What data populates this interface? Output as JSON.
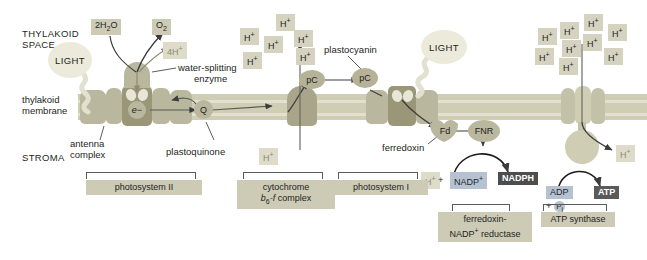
{
  "figure": {
    "regions": {
      "thylakoid_space": "THYLAKOID\nSPACE",
      "thylakoid_space_line1": "THYLAKOID",
      "thylakoid_space_line2": "SPACE",
      "membrane_line1": "thylakoid",
      "membrane_line2": "membrane",
      "stroma": "STROMA"
    },
    "light_labels": [
      "LIGHT",
      "LIGHT"
    ],
    "molecules": {
      "water": "2H2O",
      "oxygen": "O2",
      "four_protons": "4H+",
      "electron": "e−",
      "plastoquinone_symbol": "Q",
      "plastocyanin_symbol_1": "pC",
      "plastocyanin_symbol_2": "pC",
      "ferredoxin_symbol": "Fd",
      "fnr_symbol": "FNR",
      "proton": "H+",
      "nadp_plus": "NADP+",
      "nadph": "NADPH",
      "adp": "ADP",
      "plus": "+",
      "phosphate": "P",
      "phosphate_sub": "i",
      "atp": "ATP"
    },
    "callouts": {
      "water_splitting_enzyme_line1": "water-splitting",
      "water_splitting_enzyme_line2": "enzyme",
      "antenna_complex_line1": "antenna",
      "antenna_complex_line2": "complex",
      "plastoquinone": "plastoquinone",
      "plastocyanin": "plastocyanin",
      "ferredoxin": "ferredoxin"
    },
    "complex_labels": {
      "photosystem_ii": "photosystem II",
      "cytochrome_line1": "cytochrome",
      "cytochrome_line2_pre": "b",
      "cytochrome_line2_sub": "6",
      "cytochrome_line2_post": "-f complex",
      "photosystem_i": "photosystem I",
      "ferredoxin_reductase_line1": "ferredoxin-",
      "ferredoxin_reductase_line2_pre": "NADP",
      "ferredoxin_reductase_line2_sup": "+",
      "ferredoxin_reductase_line2_post": " reductase",
      "atp_synthase": "ATP synthase"
    },
    "proton_clusters": {
      "cytochrome_pumped_count": 6,
      "atp_synthase_side_count": 9,
      "cytochrome_pumped": [
        "H+",
        "H+",
        "H+",
        "H+",
        "H+",
        "H+"
      ],
      "atp_synthase_side": [
        "H+",
        "H+",
        "H+",
        "H+",
        "H+",
        "H+",
        "H+",
        "H+",
        "H+"
      ],
      "stroma_protons": [
        "H+",
        "H+"
      ]
    },
    "colors": {
      "membrane": "#cfcdb4",
      "complex_dark": "#9a9779",
      "complex_mid": "#a8a58a",
      "complex_light": "#b9b79d",
      "chip_tan": "#cdcbb6",
      "chip_blue": "#b6c2cf",
      "chip_dark": "#4d4d4d",
      "light_blob": "#eceadb",
      "arrow": "#3c3c3c",
      "background": "#ffffff"
    }
  }
}
